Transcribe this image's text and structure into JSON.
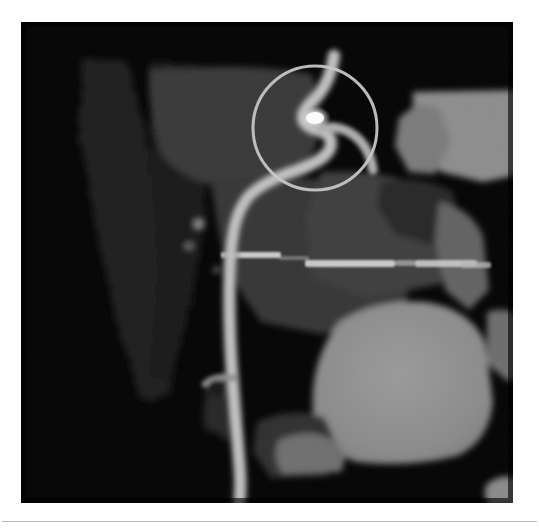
{
  "figure": {
    "kind": "ct-coronary-angiography",
    "modality_label": "CT coronary angiogram (curved MPR)",
    "background_color": "#ffffff",
    "panel": {
      "name": "scan-panel",
      "x": 21,
      "y": 22,
      "width": 492,
      "height": 481,
      "background_color": "#050505",
      "border_color": "#000000"
    },
    "rule": {
      "x": 2,
      "y": 521,
      "width": 535,
      "height": 1,
      "color": "#b9b9b9"
    }
  },
  "image_content": {
    "description": "Grayscale cardiac CT curved multiplanar reformat showing a contrast-filled coronary artery coursing from upper right to lower left, with a bright focal calcification highlighted by a thin circular marker.",
    "grayscale_levels": {
      "background_black": "#060606",
      "dark_tissue": "#1b1b1b",
      "mid_tissue": "#3a3a3a",
      "soft_tissue": "#555555",
      "bright_tissue": "#8c8c8c",
      "vessel_lumen": "#b4b4b4",
      "calcification_white": "#f2f2f2"
    },
    "structures": [
      {
        "name": "coronary-artery",
        "label": "Coronary artery (contrast-filled lumen)",
        "brightness": "#b0b0b0",
        "path_points": [
          [
            334,
            56
          ],
          [
            330,
            74
          ],
          [
            322,
            88
          ],
          [
            312,
            96
          ],
          [
            305,
            104
          ],
          [
            302,
            112
          ],
          [
            308,
            120
          ],
          [
            318,
            122
          ],
          [
            326,
            130
          ],
          [
            322,
            142
          ],
          [
            308,
            150
          ],
          [
            292,
            156
          ],
          [
            274,
            163
          ],
          [
            258,
            172
          ],
          [
            246,
            186
          ],
          [
            238,
            204
          ],
          [
            234,
            226
          ],
          [
            232,
            252
          ],
          [
            231,
            278
          ],
          [
            232,
            304
          ],
          [
            234,
            330
          ],
          [
            236,
            356
          ],
          [
            238,
            382
          ],
          [
            240,
            406
          ],
          [
            242,
            428
          ],
          [
            243,
            448
          ],
          [
            242,
            466
          ],
          [
            240,
            480
          ]
        ],
        "stroke_width": 11
      },
      {
        "name": "vessel-branch",
        "label": "Small side branch",
        "brightness": "#9a9a9a",
        "path_points": [
          [
            238,
            378
          ],
          [
            226,
            378
          ],
          [
            214,
            380
          ],
          [
            204,
            386
          ]
        ],
        "stroke_width": 7
      },
      {
        "name": "calcified-plaque",
        "label": "Focal calcified plaque / stenosis",
        "brightness": "#f5f5f5",
        "center": [
          315,
          118
        ],
        "radius_x": 9,
        "radius_y": 6
      },
      {
        "name": "upper-tissue-mass",
        "label": "Mid-grey myocardial / soft-tissue mass (upper left)",
        "brightness": "#3c3c3c",
        "bbox": [
          150,
          66,
          150,
          120
        ]
      },
      {
        "name": "upper-right-wedge",
        "label": "Bright wedge-shaped structure (upper right)",
        "brightness": "#8b8b8b",
        "bbox": [
          386,
          74,
          116,
          86
        ]
      },
      {
        "name": "central-bright-band",
        "label": "Bright horizontal band (mid image)",
        "brightness": "#cdcdcd",
        "bbox": [
          220,
          232,
          265,
          10
        ]
      },
      {
        "name": "large-bright-blob",
        "label": "Large homogeneous contrast-filled chamber (lower right)",
        "brightness": "#8e8e8e",
        "bbox": [
          300,
          284,
          168,
          156
        ]
      },
      {
        "name": "mottled-left-tissue",
        "label": "Mottled dark tissue / chest wall (left)",
        "brightness": "#262626",
        "bbox": [
          72,
          60,
          110,
          345
        ]
      },
      {
        "name": "lower-right-nodule",
        "label": "Small bright nodule (lower right)",
        "brightness": "#868686",
        "bbox": [
          462,
          458,
          46,
          30
        ]
      }
    ],
    "annotation": {
      "name": "highlight-circle",
      "label": "Circular marker highlighting the stenosis",
      "shape": "circle",
      "center_x": 315,
      "center_y": 128,
      "radius": 62,
      "stroke_color": "#c9c9c9",
      "stroke_width": 3,
      "fill": "none"
    }
  }
}
